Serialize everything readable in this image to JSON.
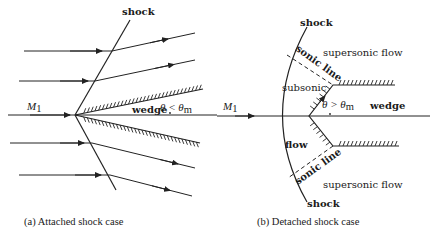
{
  "figure": {
    "panel_a": {
      "caption": "(a) Attached shock case",
      "labels": {
        "shock": "shock",
        "mach": "M",
        "mach_sub": "1",
        "wedge": "wedge",
        "angle_condition": "θ < θ",
        "angle_sub": "m"
      }
    },
    "panel_b": {
      "caption": "(b) Detached shock case",
      "labels": {
        "shock_top": "shock",
        "shock_bottom": "shock",
        "sonic_line_top": "sonic line",
        "sonic_line_bottom": "sonic line",
        "supersonic_top": "supersonic flow",
        "supersonic_bottom": "supersonic flow",
        "subsonic": "subsonic",
        "flow": "flow",
        "wedge": "wedge",
        "mach": "M",
        "mach_sub": "1",
        "angle_condition": "θ > θ",
        "angle_sub": "m"
      }
    }
  }
}
